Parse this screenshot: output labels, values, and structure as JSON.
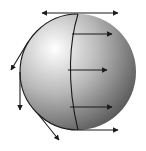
{
  "diagram": {
    "colors": {
      "line": "#1a1a1a",
      "sphere_light": "#ffffff",
      "sphere_mid": "#b0b0b0",
      "sphere_dark": "#505050",
      "background": "#ffffff"
    },
    "vectors": [
      {
        "name": "top-tangent-double-arrow",
        "kind": "double-headed"
      },
      {
        "name": "right-arrow-1",
        "kind": "single"
      },
      {
        "name": "right-arrow-2",
        "kind": "single"
      },
      {
        "name": "right-arrow-3",
        "kind": "single"
      },
      {
        "name": "bottom-tangent-arrow",
        "kind": "single"
      },
      {
        "name": "left-tangent-arrow-upper",
        "kind": "single"
      },
      {
        "name": "left-tangent-arrow-middle",
        "kind": "single"
      },
      {
        "name": "left-tangent-arrow-lower",
        "kind": "single"
      }
    ]
  }
}
